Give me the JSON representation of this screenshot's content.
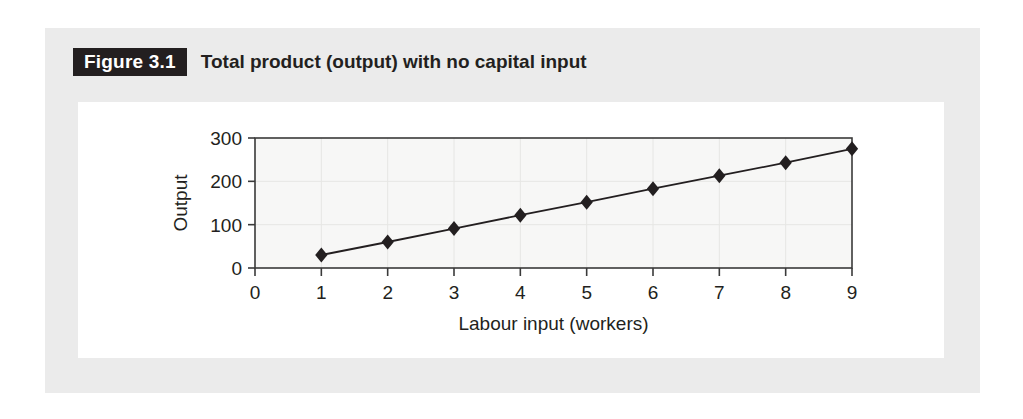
{
  "figure": {
    "badge_label": "Figure 3.1",
    "caption": "Total product (output) with no capital input"
  },
  "colors": {
    "panel_background": "#ebebeb",
    "card_background": "#ffffff",
    "badge_background": "#231f20",
    "text": "#231f20",
    "plot_background": "#f7f7f6",
    "axis_line": "#3a3a3a",
    "gridline": "#e6e6e4",
    "series_line": "#231f20",
    "marker_fill": "#231f20"
  },
  "chart_data": {
    "type": "line",
    "title": "Total product (output) with no capital input",
    "xlabel": "Labour input (workers)",
    "ylabel": "Output",
    "xlim": [
      0,
      9
    ],
    "ylim": [
      0,
      300
    ],
    "xticks": [
      0,
      1,
      2,
      3,
      4,
      5,
      6,
      7,
      8,
      9
    ],
    "xtick_labels": [
      "0",
      "1",
      "2",
      "3",
      "4",
      "5",
      "6",
      "7",
      "8",
      "9"
    ],
    "yticks": [
      0,
      100,
      200,
      300
    ],
    "ytick_labels": [
      "0",
      "100",
      "200",
      "300"
    ],
    "grid": true,
    "legend": false,
    "marker": "diamond",
    "series": [
      {
        "name": "Total product",
        "x": [
          1,
          2,
          3,
          4,
          5,
          6,
          7,
          8,
          9
        ],
        "values": [
          30,
          60,
          91,
          122,
          152,
          183,
          213,
          243,
          275
        ]
      }
    ]
  }
}
